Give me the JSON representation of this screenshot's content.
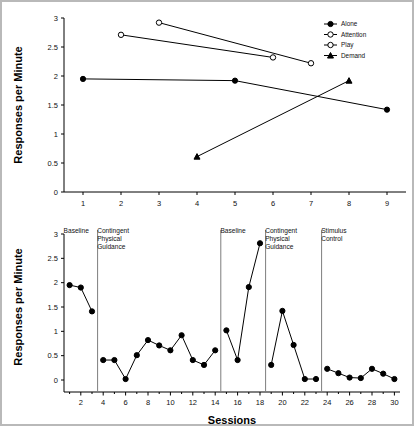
{
  "figure": {
    "frame_color": "#b9b9b9",
    "background": "#ffffff"
  },
  "chart_data": [
    {
      "id": "top",
      "type": "line",
      "title": "",
      "xlabel": "",
      "ylabel": "Responses per Minute",
      "xlim": [
        0.5,
        9.5
      ],
      "ylim": [
        0,
        3
      ],
      "yticks": [
        "0",
        "0.5",
        "1",
        "1.5",
        "2",
        "2.5",
        "3"
      ],
      "ytick_values": [
        0,
        0.5,
        1,
        1.5,
        2,
        2.5,
        3
      ],
      "xticks": [
        "1",
        "2",
        "3",
        "4",
        "5",
        "6",
        "7",
        "8",
        "9"
      ],
      "xtick_values": [
        1,
        2,
        3,
        4,
        5,
        6,
        7,
        8,
        9
      ],
      "grid": false,
      "legend_position": "top-right",
      "series": [
        {
          "name": "Alone",
          "marker": "filled-circle",
          "x": [
            1,
            5,
            9
          ],
          "values": [
            1.95,
            1.92,
            1.42
          ]
        },
        {
          "name": "Attention",
          "marker": "open-circle",
          "x": [
            2,
            6
          ],
          "values": [
            2.71,
            2.32
          ]
        },
        {
          "name": "Play",
          "marker": "open-circle",
          "x": [
            3,
            7
          ],
          "values": [
            2.92,
            2.22
          ]
        },
        {
          "name": "Demand",
          "marker": "filled-triangle",
          "x": [
            4,
            8
          ],
          "values": [
            0.61,
            1.92
          ]
        }
      ]
    },
    {
      "id": "bottom",
      "type": "line",
      "title": "",
      "xlabel": "Sessions",
      "ylabel": "Responses per Minute",
      "xlim": [
        0.5,
        30.5
      ],
      "ylim": [
        0,
        3
      ],
      "yticks": [
        "0",
        "0.5",
        "1",
        "1.5",
        "2",
        "2.5",
        "3"
      ],
      "ytick_values": [
        0,
        0.5,
        1,
        1.5,
        2,
        2.5,
        3
      ],
      "xticks": [
        "2",
        "4",
        "6",
        "8",
        "10",
        "12",
        "14",
        "16",
        "18",
        "20",
        "22",
        "24",
        "26",
        "28",
        "30"
      ],
      "xtick_values": [
        2,
        4,
        6,
        8,
        10,
        12,
        14,
        16,
        18,
        20,
        22,
        24,
        26,
        28,
        30
      ],
      "grid": false,
      "marker": "filled-circle",
      "phases": [
        {
          "label": "Baseline",
          "start": 1,
          "end": 3,
          "x": [
            1,
            2,
            3
          ],
          "values": [
            1.95,
            1.9,
            1.41
          ]
        },
        {
          "label": "Contingent Physical Guidance",
          "start": 4,
          "end": 14,
          "x": [
            4,
            5,
            6,
            7,
            8,
            9,
            10,
            11,
            12,
            13,
            14
          ],
          "values": [
            0.41,
            0.41,
            0.02,
            0.51,
            0.82,
            0.71,
            0.61,
            0.92,
            0.41,
            0.31,
            0.61
          ]
        },
        {
          "label": "Baseline",
          "start": 15,
          "end": 18,
          "x": [
            15,
            16,
            17,
            18
          ],
          "values": [
            1.02,
            0.41,
            1.91,
            2.81
          ]
        },
        {
          "label": "Contingent Physical Guidance",
          "start": 19,
          "end": 23,
          "x": [
            19,
            20,
            21,
            22,
            23
          ],
          "values": [
            0.31,
            1.42,
            0.72,
            0.02,
            0.02
          ]
        },
        {
          "label": "Stimulus Control",
          "start": 24,
          "end": 30,
          "x": [
            24,
            25,
            26,
            27,
            28,
            29,
            30
          ],
          "values": [
            0.23,
            0.14,
            0.05,
            0.04,
            0.23,
            0.13,
            0.02
          ]
        }
      ],
      "phase_dividers": [
        3.5,
        14.5,
        18.5,
        23.5
      ]
    }
  ]
}
